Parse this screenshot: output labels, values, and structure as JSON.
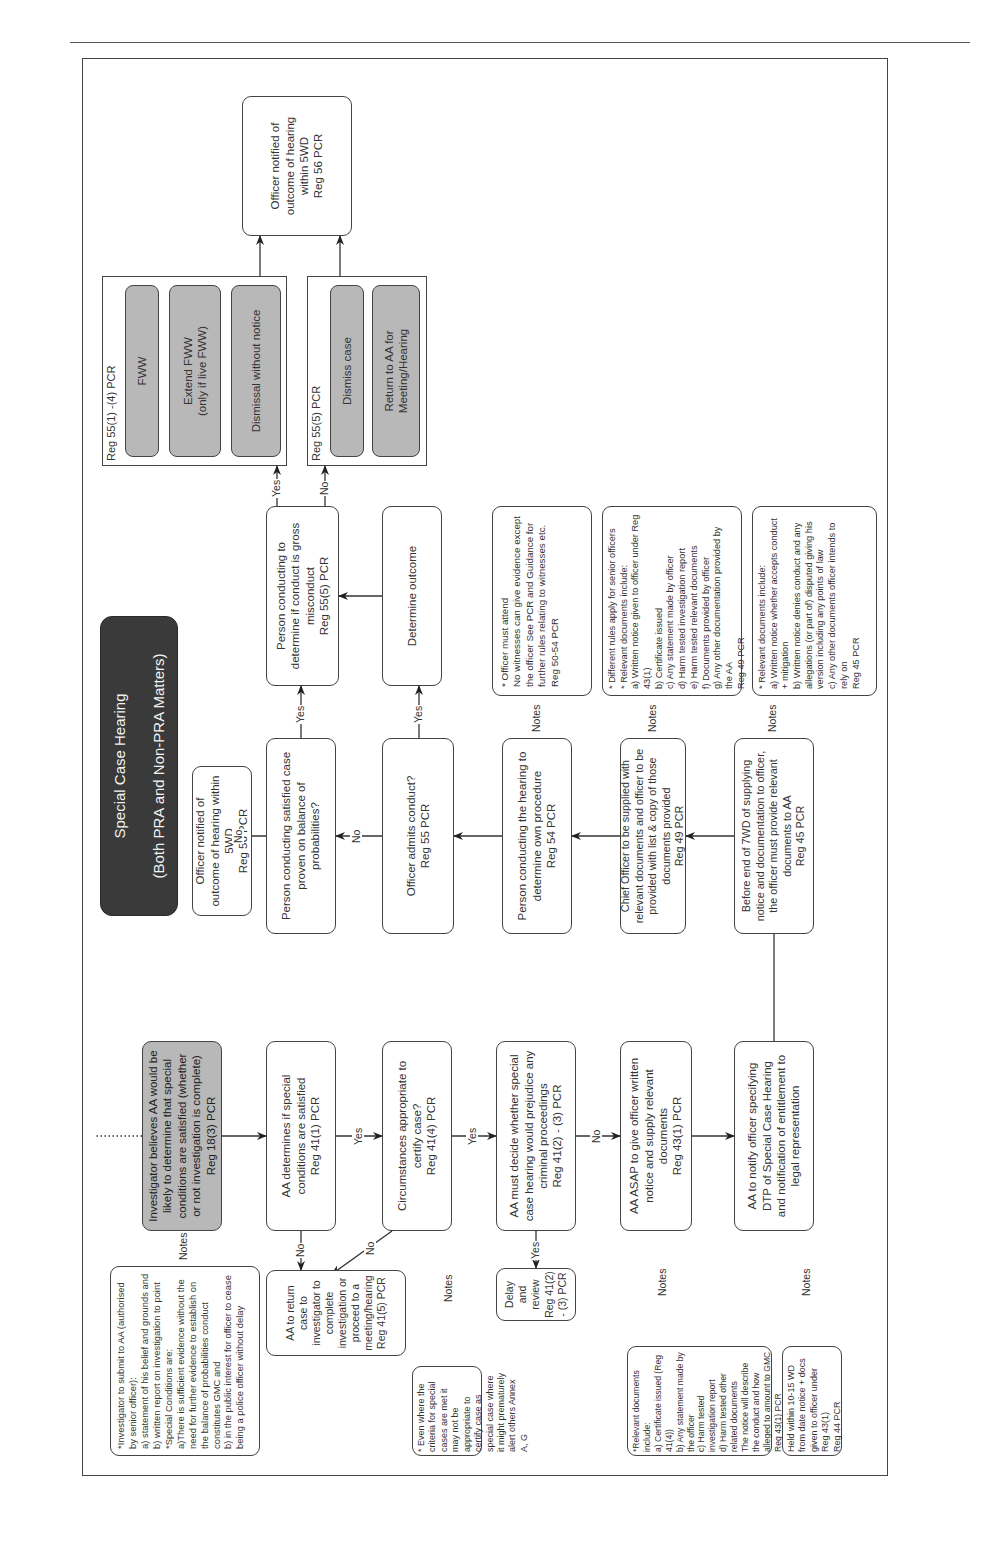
{
  "title": {
    "line1": "Special Case Hearing",
    "line2": "(Both PRA and Non-PRA Matters)"
  },
  "connector_labels": {
    "yes": "Yes",
    "no": "No",
    "notes": "Notes"
  },
  "left_flow": {
    "start": "Investigator believes AA would be likely to determine that special conditions are satisfied (whether or not investigation is complete)\nReg 18(3) PCR",
    "aa_determines": "AA determines if special conditions are satisfied\nReg 41(1) PCR",
    "return_case": "AA to return case to investigator to complete investigation or proceed to a meeting/hearing\nReg 41(5) PCR",
    "circumstances": "Circumstances appropriate to certify case?\nReg 41(4) PCR",
    "prejudice": "AA must decide whether special case hearing would prejudice any criminal proceedings\nReg 41(2) - (3) PCR",
    "delay_review": "Delay and review\nReg 41(2) - (3) PCR",
    "asap_notice": "AA ASAP to give officer written notice and supply relevant documents\nReg 43(1) PCR",
    "notify_dtp": "AA to notify officer specifying DTP of Special Case Hearing and notification of entitlement to legal representation"
  },
  "left_notes": {
    "investigator_submit": "*Investigator to submit to AA (authorised by senior officer):\na) statement of his belief and grounds and\nb) written report on investigation to point\n*Special Conditions are:\na)There is sufficient evidence without the need for further evidence to establish on the balance of probabilities conduct constitutes GMC and\nb) in the public interest for officer to cease being a police officer without delay",
    "criteria": "* Even where the criteria for special cases are met it may not be appropriate to certify case as special case where it might prematurely alert others Annex A, G",
    "relevant_docs_43": "*Relevant documents include:\na) Certificate issued (Reg 41(4))\nb) Any statement made by the officer\nc) Harm tested investigation report\nd) Harm tested other related documents\nThe notice will describe the conduct and how alleged to amount to GMC\nReg 43(1) PCR",
    "held_within": "Held within 10-15 WD from date notice + docs given to officer under Reg 43(1)\nReg 44 PCR"
  },
  "right_flow": {
    "officer_notified_top": "Officer notified of outcome of hearing within 5WD\nReg 56 PCR",
    "satisfied_case": "Person conducting satisfied case proven on balance of probabilities?",
    "admits_conduct": "Officer admits conduct?\nReg 55 PCR",
    "own_procedure": "Person conducting the hearing to determine own procedure\nReg 54 PCR",
    "chief_officer": "Chief Officer to be supplied with relevant documents and officer to be provided with list & copy of those documents provided\nReg 49 PCR",
    "before_end_7wd": "Before end of 7WD of supplying notice and documentation to officer, the officer must provide relevant documents to AA\nReg 45 PCR",
    "gross_misconduct": "Person conducting to determine if conduct is gross misconduct\nReg 55(5) PCR",
    "determine_outcome": "Determine outcome",
    "officer_notified_end": "Officer notified of outcome of hearing within 5WD\nReg 56 PCR"
  },
  "outcome_groups": [
    {
      "label": "Reg 55(1) -(4) PCR",
      "options": [
        "FWW",
        "Extend FWW\n(only if live FWW)",
        "Dismissal without notice"
      ]
    },
    {
      "label": "Reg 55(5) PCR",
      "options": [
        "Dismiss case",
        "Return to AA for Meeting/Hearing"
      ]
    }
  ],
  "right_notes": {
    "attendance": "* Officer must attend\nNo witnesses can give evidence except the officer See PCR and Guidance for further rules relating to witnesses etc.\nReg 50-54 PCR",
    "senior_officers": "* Different rules apply for senior officers\n* Relevant documents include:\na) Written notice given to officer under Reg 43(1)\nb) Certificate issued\nc) Any statement made by officer\nd) Harm tested investigation report\ne) Harm tested relevant documents\nf) Documents provided by officer\ng) Any other documentation provided by the AA\nReg 49 PCR",
    "officer_docs": "* Relevant documents include:\na) Written notice whether accepts conduct + mitigation\nb) Written notice denies conduct and any allegations (or part of) disputed giving his version including any points of law\nc) Any other documents officer intends to rely on\nReg 45 PCR"
  }
}
